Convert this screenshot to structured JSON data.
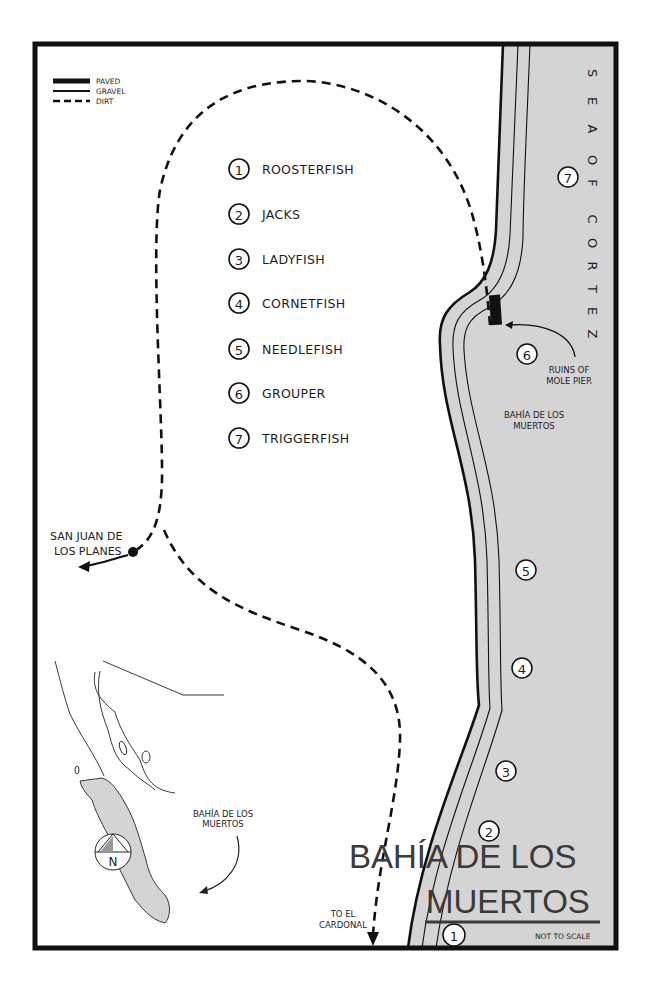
{
  "map": {
    "title_line1": "BAHÍA DE LOS",
    "title_line2": "MUERTOS",
    "scale_note": "NOT TO SCALE",
    "colors": {
      "water": "#d4d4d4",
      "land": "#ffffff",
      "ink": "#111111",
      "title_ink": "#3a3a3a"
    }
  },
  "legend": {
    "items": [
      {
        "style": "paved",
        "label": "PAVED"
      },
      {
        "style": "gravel",
        "label": "GRAVEL"
      },
      {
        "style": "dirt",
        "label": "DIRT"
      }
    ]
  },
  "fish_key": [
    {
      "num": "1",
      "label": "ROOSTERFISH"
    },
    {
      "num": "2",
      "label": "JACKS"
    },
    {
      "num": "3",
      "label": "LADYFISH"
    },
    {
      "num": "4",
      "label": "CORNETFISH"
    },
    {
      "num": "5",
      "label": "NEEDLEFISH"
    },
    {
      "num": "6",
      "label": "GROUPER"
    },
    {
      "num": "7",
      "label": "TRIGGERFISH"
    }
  ],
  "markers": [
    {
      "num": "7"
    },
    {
      "num": "6"
    },
    {
      "num": "5"
    },
    {
      "num": "4"
    },
    {
      "num": "3"
    },
    {
      "num": "2"
    },
    {
      "num": "1"
    }
  ],
  "labels": {
    "sea_letters": [
      "S",
      "E",
      "A",
      "O",
      "F",
      "C",
      "O",
      "R",
      "T",
      "E",
      "Z"
    ],
    "ruins_line1": "RUINS OF",
    "ruins_line2": "MOLE PIER",
    "bay_line1": "BAHÍA DE LOS",
    "bay_line2": "MUERTOS",
    "san_juan_line1": "SAN JUAN DE",
    "san_juan_line2": "LOS PLANES",
    "cardonal_line1": "TO EL",
    "cardonal_line2": "CARDONAL",
    "inset_line1": "BAHÍA DE LOS",
    "inset_line2": "MUERTOS",
    "compass": "N"
  }
}
